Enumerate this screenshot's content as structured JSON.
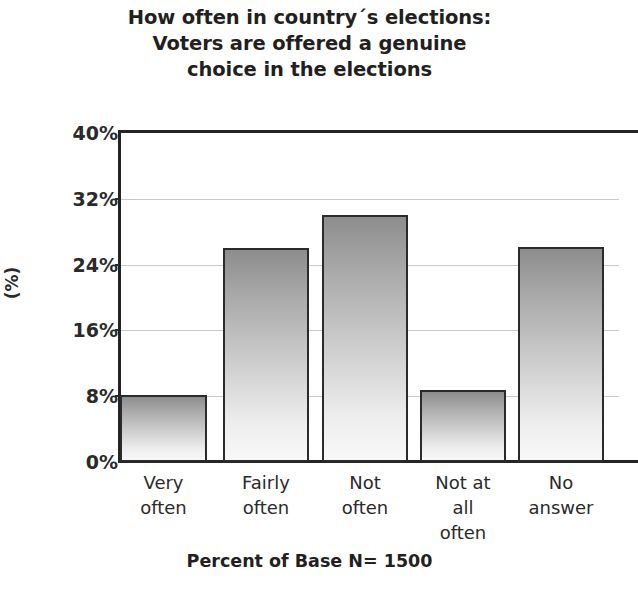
{
  "chart_data": {
    "type": "bar",
    "title": "How often in country´s elections: Voters are offered a genuine choice in the elections",
    "title_lines": [
      "How often in country´s elections:",
      "Voters are offered a genuine",
      "choice in the elections"
    ],
    "categories": [
      "Very often",
      "Fairly often",
      "Not often",
      "Not at all often",
      "No answer"
    ],
    "category_lines": [
      [
        "Very",
        "often"
      ],
      [
        "Fairly",
        "often"
      ],
      [
        "Not",
        "often"
      ],
      [
        "Not at",
        "all",
        "often"
      ],
      [
        "No",
        "answer"
      ]
    ],
    "values": [
      8.2,
      26.0,
      30.0,
      8.7,
      26.2
    ],
    "xlabel": "Percent of Base N= 1500",
    "ylabel": "(%)",
    "ylim": [
      0,
      40
    ],
    "yticks": [
      0,
      8,
      16,
      24,
      32,
      40
    ],
    "ytick_labels": [
      "0%",
      "8%",
      "16%",
      "24%",
      "32%",
      "40%"
    ],
    "grid": true,
    "legend": "none",
    "colors": {
      "bar_gradient_top": "#8d8d8d",
      "bar_gradient_bottom": "#f8f8f8",
      "bar_outline": "#2b2b2b",
      "axis": "#242424",
      "gridline": "#c9c9c9",
      "text": "#231f20",
      "background": "#ffffff"
    }
  },
  "footer": {
    "note": "Percent of Base N= 1500"
  }
}
